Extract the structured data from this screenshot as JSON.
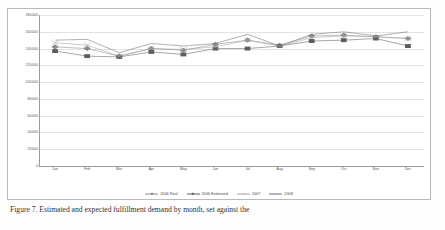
{
  "figure": {
    "caption": "Figure 7. Estimated and expected fulfillment demand by month, set against the"
  },
  "chart_data": {
    "type": "line",
    "title": "",
    "xlabel": "",
    "ylabel": "",
    "ylim": [
      0,
      180000
    ],
    "ytick_step": 20000,
    "grid": true,
    "legend_position": "bottom",
    "categories": [
      "Jan",
      "Feb",
      "Mar",
      "Apr",
      "May",
      "Jun",
      "Jul",
      "Aug",
      "Sep",
      "Oct",
      "Nov",
      "Dec"
    ],
    "ytick_labels": [
      "180000",
      "160000",
      "140000",
      "120000",
      "100000",
      "80000",
      "60000",
      "40000",
      "20000",
      "0"
    ],
    "ytick_values": [
      180000,
      160000,
      140000,
      120000,
      100000,
      80000,
      60000,
      40000,
      20000,
      0
    ],
    "series": [
      {
        "name": "2006 Real",
        "marker": "diamond",
        "color": "#8a8a8a",
        "values": [
          142000,
          140000,
          131000,
          140000,
          138000,
          145000,
          150000,
          144000,
          155000,
          156000,
          154000,
          152000
        ]
      },
      {
        "name": "2006 Estimated",
        "marker": "square",
        "color": "#5d5d5d",
        "values": [
          137000,
          131000,
          130000,
          136000,
          133000,
          140000,
          140000,
          143000,
          149000,
          150000,
          152000,
          143000
        ]
      },
      {
        "name": "2007",
        "marker": "cross",
        "color": "#a3a3a3",
        "values": [
          147000,
          144000,
          131000,
          140000,
          139000,
          142000,
          150000,
          143000,
          153000,
          155000,
          154000,
          152000
        ]
      },
      {
        "name": "2008",
        "marker": "none",
        "color": "#6f6f6f",
        "values": [
          150000,
          151000,
          135000,
          146000,
          143000,
          146000,
          157000,
          143000,
          157000,
          160000,
          155000,
          160000
        ]
      }
    ]
  }
}
